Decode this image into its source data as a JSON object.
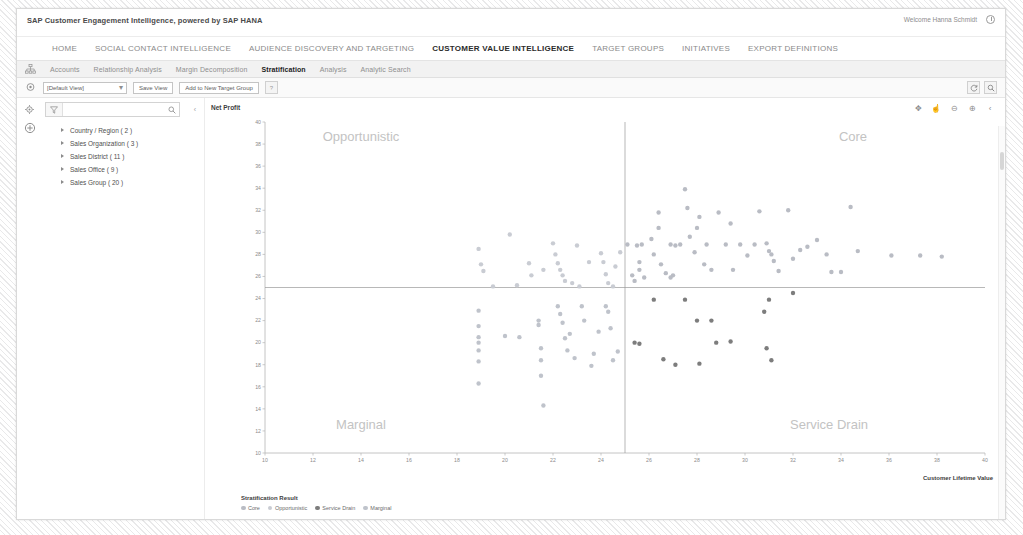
{
  "window": {
    "app_title": "SAP Customer Engagement Intelligence, powered by SAP HANA",
    "welcome_text": "Welcome Hanna Schmidt",
    "logoff_icon": "power-icon"
  },
  "main_nav": {
    "items": [
      {
        "label": "HOME",
        "active": false
      },
      {
        "label": "SOCIAL CONTACT INTELLIGENCE",
        "active": false
      },
      {
        "label": "AUDIENCE DISCOVERY AND TARGETING",
        "active": false
      },
      {
        "label": "CUSTOMER VALUE INTELLIGENCE",
        "active": true
      },
      {
        "label": "TARGET GROUPS",
        "active": false
      },
      {
        "label": "INITIATIVES",
        "active": false
      },
      {
        "label": "EXPORT DEFINITIONS",
        "active": false
      }
    ]
  },
  "sub_nav": {
    "left_icon": "org-chart-icon",
    "tabs": [
      {
        "label": "Accounts",
        "active": false
      },
      {
        "label": "Relationship Analysis",
        "active": false
      },
      {
        "label": "Margin Decomposition",
        "active": false
      },
      {
        "label": "Stratification",
        "active": true
      },
      {
        "label": "Analysis",
        "active": false
      },
      {
        "label": "Analytic Search",
        "active": false
      }
    ]
  },
  "view_toolbar": {
    "left_icon": "target-group-icon",
    "view_select_value": "[Default View]",
    "save_view_label": "Save View",
    "add_target_group_label": "Add to New Target Group",
    "help_icon": "question-icon",
    "refresh_icon": "refresh-icon",
    "settings_icon": "search-settings-icon"
  },
  "sidebar": {
    "rail_icons": [
      "settings-gear-icon",
      "add-circle-icon"
    ],
    "filter_icon": "filter-icon",
    "search_placeholder": "",
    "search_value": "",
    "search_icon": "search-icon",
    "collapse_icon": "chevron-left-icon",
    "tree": [
      {
        "label": "Country / Region ( 2 )"
      },
      {
        "label": "Sales Organization ( 3 )"
      },
      {
        "label": "Sales District ( 11 )"
      },
      {
        "label": "Sales Office ( 9 )"
      },
      {
        "label": "Sales Group ( 20 )"
      }
    ]
  },
  "chart_toolbar": {
    "icons": [
      {
        "name": "pan-move-icon",
        "glyph": "✥"
      },
      {
        "name": "pointer-hand-icon",
        "glyph": "☝"
      },
      {
        "name": "zoom-out-icon",
        "glyph": "⊖"
      },
      {
        "name": "zoom-in-icon",
        "glyph": "⊕"
      },
      {
        "name": "collapse-chevron-icon",
        "glyph": "‹"
      }
    ]
  },
  "chart_data": {
    "type": "scatter",
    "title": "",
    "xlabel": "Customer Lifetime Value",
    "ylabel": "Net Profit",
    "xlim": [
      10,
      40
    ],
    "ylim": [
      10,
      40
    ],
    "xticks": [
      10,
      12,
      14,
      16,
      18,
      20,
      22,
      24,
      26,
      28,
      30,
      32,
      34,
      36,
      38,
      40
    ],
    "yticks": [
      10,
      12,
      14,
      16,
      18,
      20,
      22,
      24,
      26,
      28,
      30,
      32,
      34,
      36,
      38,
      40
    ],
    "grid": false,
    "legend_position": "bottom-left",
    "legend_title": "Stratification Result",
    "reference_lines": {
      "vertical_x": 25,
      "horizontal_y": 25
    },
    "quadrant_labels": [
      {
        "text": "Opportunistic",
        "x": 14.0,
        "y": 38.3
      },
      {
        "text": "Core",
        "x": 34.5,
        "y": 38.3
      },
      {
        "text": "Marginal",
        "x": 14.0,
        "y": 12.2
      },
      {
        "text": "Service Drain",
        "x": 33.5,
        "y": 12.2
      }
    ],
    "series": [
      {
        "name": "Core",
        "color": "#b9bcc4",
        "points": [
          [
            25.1,
            28.9
          ],
          [
            25.3,
            26.1
          ],
          [
            25.4,
            25.6
          ],
          [
            25.5,
            28.8
          ],
          [
            25.6,
            27.3
          ],
          [
            25.6,
            26.6
          ],
          [
            25.7,
            28.9
          ],
          [
            25.8,
            25.9
          ],
          [
            26.1,
            29.4
          ],
          [
            26.2,
            28.0
          ],
          [
            26.4,
            31.8
          ],
          [
            26.4,
            30.4
          ],
          [
            26.5,
            27.1
          ],
          [
            26.7,
            26.3
          ],
          [
            26.9,
            28.9
          ],
          [
            27.1,
            28.8
          ],
          [
            27.3,
            28.9
          ],
          [
            27.5,
            33.9
          ],
          [
            27.6,
            32.2
          ],
          [
            27.7,
            29.6
          ],
          [
            27.9,
            28.2
          ],
          [
            28.1,
            31.4
          ],
          [
            28.3,
            27.1
          ],
          [
            28.4,
            28.9
          ],
          [
            28.6,
            26.6
          ],
          [
            28.9,
            31.8
          ],
          [
            29.2,
            28.9
          ],
          [
            29.4,
            30.8
          ],
          [
            29.5,
            26.6
          ],
          [
            29.8,
            28.9
          ],
          [
            30.1,
            27.9
          ],
          [
            30.4,
            28.9
          ],
          [
            30.6,
            31.9
          ],
          [
            30.9,
            29.0
          ],
          [
            31.0,
            28.3
          ],
          [
            31.1,
            28.0
          ],
          [
            31.2,
            27.4
          ],
          [
            31.4,
            26.5
          ],
          [
            31.8,
            32.0
          ],
          [
            32.0,
            27.6
          ],
          [
            32.3,
            28.4
          ],
          [
            32.6,
            28.7
          ],
          [
            33.0,
            29.3
          ],
          [
            33.4,
            28.0
          ],
          [
            33.6,
            26.4
          ],
          [
            34.0,
            26.4
          ],
          [
            34.4,
            32.3
          ],
          [
            34.7,
            28.3
          ],
          [
            36.1,
            27.9
          ],
          [
            37.3,
            27.9
          ],
          [
            38.2,
            27.8
          ],
          [
            27.0,
            26.1
          ],
          [
            26.9,
            25.9
          ],
          [
            28.0,
            30.4
          ]
        ]
      },
      {
        "name": "Opportunistic",
        "color": "#c9ccd3",
        "points": [
          [
            18.9,
            28.5
          ],
          [
            19.0,
            27.1
          ],
          [
            19.1,
            26.5
          ],
          [
            20.2,
            29.8
          ],
          [
            21.0,
            27.2
          ],
          [
            21.1,
            26.1
          ],
          [
            22.0,
            29.0
          ],
          [
            22.1,
            28.0
          ],
          [
            22.2,
            27.2
          ],
          [
            22.3,
            26.6
          ],
          [
            22.4,
            26.1
          ],
          [
            22.5,
            25.6
          ],
          [
            23.0,
            28.8
          ],
          [
            23.5,
            27.3
          ],
          [
            24.0,
            28.1
          ],
          [
            24.1,
            27.3
          ],
          [
            24.2,
            26.2
          ],
          [
            24.3,
            25.4
          ],
          [
            24.5,
            25.1
          ],
          [
            24.8,
            28.2
          ],
          [
            19.5,
            25.1
          ],
          [
            20.5,
            25.2
          ],
          [
            23.1,
            25.1
          ],
          [
            22.8,
            25.4
          ],
          [
            21.6,
            26.6
          ],
          [
            24.6,
            26.9
          ]
        ]
      },
      {
        "name": "Service Drain",
        "color": "#7d7d7d",
        "points": [
          [
            25.4,
            20.0
          ],
          [
            25.6,
            19.9
          ],
          [
            26.6,
            18.5
          ],
          [
            27.1,
            18.0
          ],
          [
            28.0,
            22.0
          ],
          [
            28.6,
            22.0
          ],
          [
            28.8,
            20.0
          ],
          [
            29.4,
            20.1
          ],
          [
            30.8,
            22.8
          ],
          [
            30.9,
            19.5
          ],
          [
            31.1,
            18.4
          ],
          [
            31.0,
            23.9
          ],
          [
            32.0,
            24.5
          ],
          [
            28.1,
            18.1
          ],
          [
            26.2,
            23.9
          ],
          [
            27.5,
            23.9
          ]
        ]
      },
      {
        "name": "Marginal",
        "color": "#bfc3cb",
        "points": [
          [
            18.9,
            22.9
          ],
          [
            18.9,
            21.5
          ],
          [
            18.9,
            20.5
          ],
          [
            18.9,
            20.0
          ],
          [
            18.9,
            19.3
          ],
          [
            18.9,
            18.3
          ],
          [
            18.9,
            16.3
          ],
          [
            20.0,
            20.6
          ],
          [
            20.6,
            20.5
          ],
          [
            21.4,
            22.0
          ],
          [
            21.4,
            21.6
          ],
          [
            21.5,
            19.5
          ],
          [
            21.5,
            18.4
          ],
          [
            21.5,
            17.0
          ],
          [
            21.6,
            14.3
          ],
          [
            22.2,
            23.3
          ],
          [
            22.3,
            22.6
          ],
          [
            22.4,
            21.8
          ],
          [
            22.5,
            20.4
          ],
          [
            22.6,
            19.3
          ],
          [
            22.7,
            20.8
          ],
          [
            23.2,
            23.3
          ],
          [
            23.3,
            22.0
          ],
          [
            23.6,
            17.9
          ],
          [
            23.7,
            19.0
          ],
          [
            24.2,
            23.3
          ],
          [
            24.3,
            22.8
          ],
          [
            24.4,
            21.3
          ],
          [
            24.5,
            18.4
          ],
          [
            24.7,
            19.2
          ],
          [
            22.9,
            18.6
          ],
          [
            23.9,
            21.0
          ]
        ]
      }
    ]
  }
}
